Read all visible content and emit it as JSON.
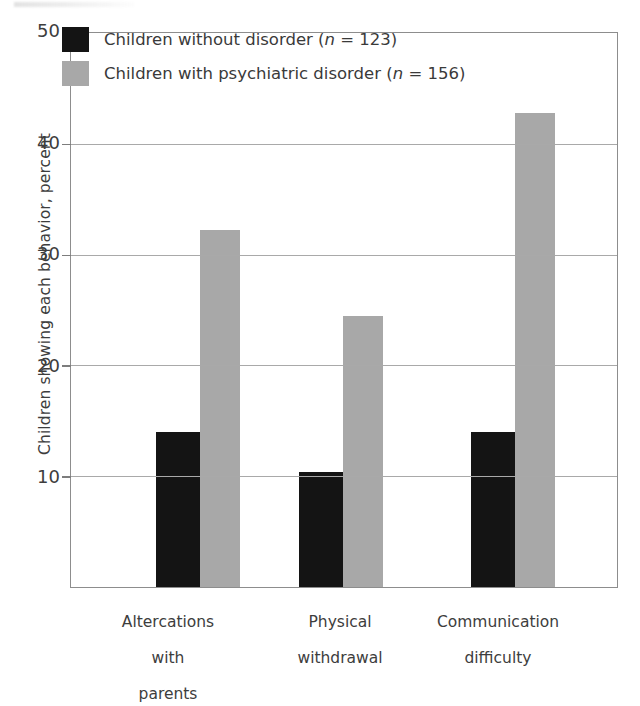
{
  "chart_data": {
    "type": "bar",
    "title": "",
    "subtitle": "",
    "xlabel": "",
    "ylabel": "Children showing each behavior, percent",
    "ylim": [
      0,
      50
    ],
    "yticks": [
      10,
      20,
      30,
      40,
      50
    ],
    "ytick_labels": [
      "10",
      "20",
      "30",
      "40",
      "50"
    ],
    "grid": true,
    "legend_position": "upper left",
    "categories": [
      "Altercations\nwith\nparents",
      "Physical\nwithdrawal",
      "Communication\ndifficulty"
    ],
    "categories_flat": [
      "Altercations with parents",
      "Physical withdrawal",
      "Communication difficulty"
    ],
    "series": [
      {
        "name": "Children without disorder (n=123)",
        "short_name": "Children without disorder",
        "n": 123,
        "color": "#141414",
        "values": [
          14.0,
          10.4,
          14.0
        ]
      },
      {
        "name": "Children with psychiatric disorder (n=156)",
        "short_name": "Children with psychiatric disorder",
        "n": 156,
        "color": "#a8a8a8",
        "values": [
          32.2,
          24.5,
          42.8
        ]
      }
    ]
  },
  "axis": {
    "ylabel": "Children showing each behavior, percent",
    "tick_50": "50",
    "tick_40": "40",
    "tick_30": "30",
    "tick_20": "20",
    "tick_10": "10"
  },
  "legend": {
    "entries": [
      {
        "label_prefix": "Children without disorder (",
        "label_italic": "n",
        "label_suffix": " = 123)",
        "color": "#141414"
      },
      {
        "label_prefix": "Children with psychiatric disorder (",
        "label_italic": "n",
        "label_suffix": " = 156)",
        "color": "#a8a8a8"
      }
    ]
  },
  "categories": {
    "group1_line1": "Altercations",
    "group1_line2": "with",
    "group1_line3": "parents",
    "group2_line1": "Physical",
    "group2_line2": "withdrawal",
    "group3_line1": "Communication",
    "group3_line2": "difficulty"
  }
}
